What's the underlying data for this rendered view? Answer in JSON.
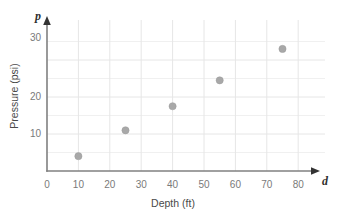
{
  "chart_data": {
    "type": "scatter",
    "title": "",
    "xlabel": "Depth (ft)",
    "ylabel": "Pressure (psi)",
    "x_axis_variable": "d",
    "y_axis_variable": "p",
    "xlim": [
      0,
      86
    ],
    "ylim": [
      0,
      36
    ],
    "xticks": [
      0,
      10,
      20,
      30,
      40,
      50,
      60,
      70,
      80
    ],
    "xtick_labels": [
      "0",
      "10",
      "20",
      "30",
      "40",
      "50",
      "60",
      "70",
      "80"
    ],
    "yticks": [
      10,
      20,
      30
    ],
    "ytick_labels": [
      "10",
      "20",
      "30"
    ],
    "grid": true,
    "grid_x_step": 10,
    "grid_y_step": 5,
    "legend": "none",
    "point_color": "#a8a8a8",
    "axis_color": "#808080",
    "grid_color": "#efefef",
    "x": [
      10,
      25,
      40,
      55,
      75
    ],
    "y": [
      4,
      11,
      17.5,
      24.5,
      33
    ],
    "points": [
      {
        "d": 10,
        "p": 4
      },
      {
        "d": 25,
        "p": 11
      },
      {
        "d": 40,
        "p": 17.5
      },
      {
        "d": 55,
        "p": 24.5
      },
      {
        "d": 75,
        "p": 33
      }
    ]
  },
  "labels": {
    "x_title": "Depth (ft)",
    "y_title": "Pressure (psi)",
    "x_var": "d",
    "y_var": "p",
    "xt0": "0",
    "xt1": "10",
    "xt2": "20",
    "xt3": "30",
    "xt4": "40",
    "xt5": "50",
    "xt6": "60",
    "xt7": "70",
    "xt8": "80",
    "yt1": "10",
    "yt2": "20",
    "yt3": "30"
  }
}
